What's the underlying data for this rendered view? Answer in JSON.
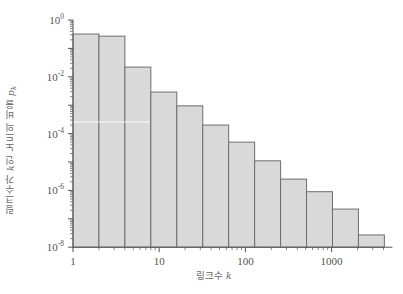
{
  "chart_data": {
    "type": "bar",
    "title": "",
    "xlabel": "링크수 k",
    "xlabel_text": "링크수",
    "xlabel_var": "k",
    "ylabel": "링크수가 k인 노드의 비율 p_k",
    "ylabel_prefix": "링크수가",
    "ylabel_var": "k",
    "ylabel_suffix": "인 노드의 비율",
    "ylabel_var2": "p",
    "ylabel_sub": "k",
    "xscale": "log",
    "yscale": "log",
    "xlim": [
      1,
      4096
    ],
    "ylim": [
      1e-08,
      1
    ],
    "x_tick_labels": [
      "1",
      "10",
      "100",
      "1000"
    ],
    "x_ticks": [
      1,
      10,
      100,
      1000
    ],
    "y_tick_labels": [
      {
        "base": "10",
        "exp": "0"
      },
      {
        "base": "10",
        "exp": "-2"
      },
      {
        "base": "10",
        "exp": "-4"
      },
      {
        "base": "10",
        "exp": "-6"
      },
      {
        "base": "10",
        "exp": "-8"
      }
    ],
    "y_ticks": [
      1,
      0.01,
      0.0001,
      1e-06,
      1e-08
    ],
    "bins": [
      {
        "k_min": 1,
        "k_max": 2,
        "value": 0.32
      },
      {
        "k_min": 2,
        "k_max": 4,
        "value": 0.27
      },
      {
        "k_min": 4,
        "k_max": 8,
        "value": 0.022
      },
      {
        "k_min": 8,
        "k_max": 16,
        "value": 0.0029
      },
      {
        "k_min": 16,
        "k_max": 32,
        "value": 0.00095
      },
      {
        "k_min": 32,
        "k_max": 64,
        "value": 0.0002
      },
      {
        "k_min": 64,
        "k_max": 128,
        "value": 5e-05
      },
      {
        "k_min": 128,
        "k_max": 256,
        "value": 1.1e-05
      },
      {
        "k_min": 256,
        "k_max": 512,
        "value": 2.5e-06
      },
      {
        "k_min": 512,
        "k_max": 1024,
        "value": 9e-07
      },
      {
        "k_min": 1024,
        "k_max": 2048,
        "value": 2.2e-07
      },
      {
        "k_min": 2048,
        "k_max": 4096,
        "value": 2.7e-08
      }
    ],
    "categories": [
      "1-2",
      "2-4",
      "4-8",
      "8-16",
      "16-32",
      "32-64",
      "64-128",
      "128-256",
      "256-512",
      "512-1024",
      "1024-2048",
      "2048-4096"
    ],
    "values": [
      0.32,
      0.27,
      0.022,
      0.0029,
      0.00095,
      0.0002,
      5e-05,
      1.1e-05,
      2.5e-06,
      9e-07,
      2.2e-07,
      2.7e-08
    ],
    "grid": false,
    "legend": null,
    "colors": {
      "bar_fill": "#d9d9d9",
      "bar_edge": "#6e6e6e",
      "axis": "#555555",
      "text": "#555555"
    }
  }
}
